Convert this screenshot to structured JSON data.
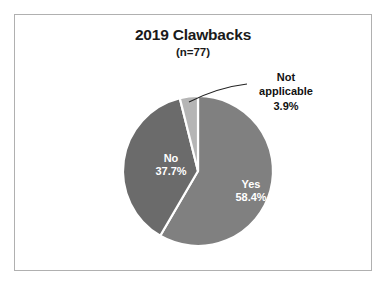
{
  "chart_data": {
    "type": "pie",
    "title": "2019 Clawbacks",
    "subtitle": "(n=77)",
    "xlabel": "",
    "ylabel": "",
    "legend": "none",
    "grid": false,
    "total_n": 77,
    "categories": [
      "Yes",
      "No",
      "Not applicable"
    ],
    "values": [
      58.4,
      37.7,
      3.9
    ],
    "value_unit": "percent",
    "slices": [
      {
        "label": "Yes",
        "value": 58.4,
        "value_text": "58.4%",
        "color": "#808080",
        "label_placement": "inside",
        "label_color": "#ffffff"
      },
      {
        "label": "No",
        "value": 37.7,
        "value_text": "37.7%",
        "color": "#6b6b6b",
        "label_placement": "inside",
        "label_color": "#ffffff"
      },
      {
        "label": "Not applicable",
        "value": 3.9,
        "value_text": "3.9%",
        "color": "#b5b5b5",
        "label_placement": "outside-callout",
        "label_color": "#111111"
      }
    ]
  },
  "labels": {
    "yes": "Yes\n58.4%",
    "no": "No\n37.7%",
    "not_applicable": "Not\napplicable\n3.9%"
  },
  "style": {
    "frame_border": "#b0b0b0",
    "background": "#ffffff",
    "title_color": "#1a1a1a",
    "slice_gap": "#ffffff",
    "leader_line": "#222222"
  }
}
